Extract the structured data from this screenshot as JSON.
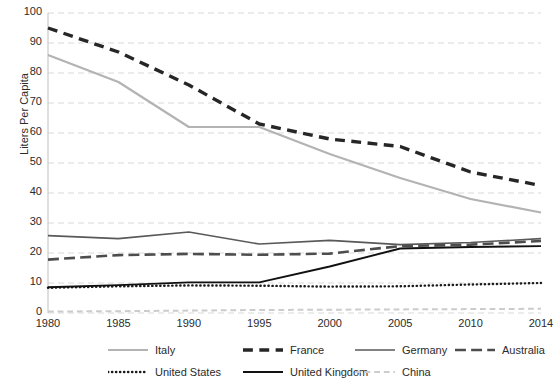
{
  "chart_data": {
    "type": "line",
    "title": "",
    "xlabel": "",
    "ylabel": "Liters Per Capita",
    "x": [
      1980,
      1985,
      1990,
      1995,
      2000,
      2005,
      2010,
      2014
    ],
    "xticklabels": [
      "1980",
      "1985",
      "1990",
      "1995",
      "2000",
      "2005",
      "2010",
      "2014"
    ],
    "yticklabels": [
      "0",
      "10",
      "20",
      "30",
      "40",
      "50",
      "60",
      "70",
      "80",
      "90",
      "100"
    ],
    "yticks": [
      0,
      10,
      20,
      30,
      40,
      50,
      60,
      70,
      80,
      90,
      100
    ],
    "ylim": [
      0,
      100
    ],
    "grid": "horizontal-dashed",
    "legend_position": "bottom",
    "series": [
      {
        "name": "Italy",
        "color": "#b3b3b3",
        "style": "solid",
        "width": 2.2,
        "values": [
          86,
          77,
          62,
          62,
          53,
          45,
          38,
          33.5
        ]
      },
      {
        "name": "France",
        "color": "#262626",
        "style": "dashed",
        "width": 3.4,
        "values": [
          95,
          87,
          76,
          63,
          58,
          55.5,
          47,
          42.5
        ]
      },
      {
        "name": "Germany",
        "color": "#595959",
        "style": "solid",
        "width": 1.6,
        "values": [
          25.8,
          24.8,
          27,
          23,
          24.2,
          22.8,
          23.5,
          24.8
        ]
      },
      {
        "name": "Australia",
        "color": "#4d4d4d",
        "style": "dashed-long",
        "width": 2.6,
        "values": [
          17.8,
          19.3,
          19.7,
          19.4,
          19.8,
          22.3,
          22.8,
          24
        ]
      },
      {
        "name": "United States",
        "color": "#1a1a1a",
        "style": "dotted",
        "width": 2.4,
        "values": [
          8.4,
          8.9,
          9.2,
          9.1,
          8.8,
          8.9,
          9.5,
          10
        ]
      },
      {
        "name": "United Kingdom",
        "color": "#111111",
        "style": "solid",
        "width": 1.9,
        "values": [
          8.6,
          9.3,
          10.2,
          10.2,
          15.5,
          21.5,
          22,
          22.3
        ]
      },
      {
        "name": "China",
        "color": "#cccccc",
        "style": "dashed",
        "width": 2.0,
        "values": [
          0.5,
          0.6,
          0.8,
          1,
          1.1,
          1.2,
          1.3,
          1.4
        ]
      }
    ]
  },
  "legend": {
    "items": [
      {
        "label": "Italy"
      },
      {
        "label": "France"
      },
      {
        "label": "Germany"
      },
      {
        "label": "Australia"
      },
      {
        "label": "United States"
      },
      {
        "label": "United Kingdom"
      },
      {
        "label": "China"
      }
    ]
  }
}
